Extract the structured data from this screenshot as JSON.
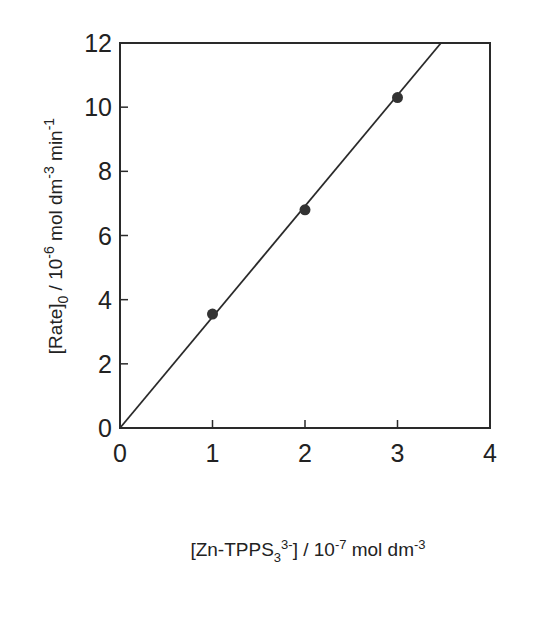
{
  "chart_data": {
    "type": "scatter",
    "title": "",
    "xlabel": "[Zn-TPPS3 3-] / 10-7 mol dm-3",
    "ylabel": "[Rate]0 / 10-6 mol dm-3 min-1",
    "xlabel_parts": {
      "pre": "[Zn-TPPS",
      "sub": "3",
      "sup": "3-",
      "post": "] / 10",
      "exp": "-7",
      "unit": " mol dm",
      "unit_exp": "-3"
    },
    "ylabel_parts": {
      "pre": "[Rate]",
      "sub": "0",
      "mid": " / 10",
      "exp": "-6",
      "unit": " mol dm",
      "unit_exp": "-3",
      "unit2": " min",
      "unit2_exp": "-1"
    },
    "xlim": [
      0,
      4
    ],
    "ylim": [
      0,
      12
    ],
    "xticks": [
      "0",
      "1",
      "2",
      "3",
      "4"
    ],
    "yticks": [
      "0",
      "2",
      "4",
      "6",
      "8",
      "10",
      "12"
    ],
    "grid": false,
    "legend": null,
    "series": [
      {
        "name": "data",
        "marker": "filled-circle",
        "x": [
          1,
          2,
          3
        ],
        "y": [
          3.55,
          6.8,
          10.3
        ]
      },
      {
        "name": "linear fit",
        "style": "line",
        "x": [
          0,
          3.47
        ],
        "y": [
          0,
          12
        ]
      }
    ]
  }
}
